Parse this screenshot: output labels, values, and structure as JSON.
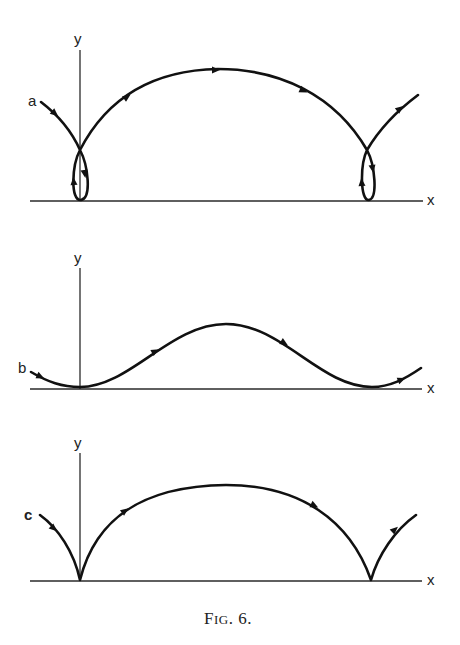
{
  "figure": {
    "caption_prefix": "F",
    "caption_smallcaps": "IG",
    "caption_suffix": ". 6.",
    "caption_full": "FIG. 6."
  },
  "panels": [
    {
      "id": "a",
      "label": "a",
      "axis_x_label": "x",
      "axis_y_label": "y",
      "curve_type": "prolate trochoid (looped)",
      "description": "Curve descends from upper-left, crosses the y-axis forming a small loop touching the x-axis, rises in a large arch, and forms a second loop near the right before exiting upward."
    },
    {
      "id": "b",
      "label": "b",
      "axis_x_label": "x",
      "axis_y_label": "y",
      "curve_type": "curtate trochoid (wave)",
      "description": "Smooth wave curve with minima touching the x-axis at the y-axis and near the right end, with a rounded peak in between."
    },
    {
      "id": "c",
      "label": "c",
      "axis_x_label": "x",
      "axis_y_label": "y",
      "curve_type": "cycloid (cusped)",
      "description": "Arch curve with sharp cusps touching the x-axis at the y-axis and near the right end."
    }
  ],
  "colors": {
    "ink": "#111111",
    "axis": "#2a2a2a",
    "background": "#ffffff"
  }
}
